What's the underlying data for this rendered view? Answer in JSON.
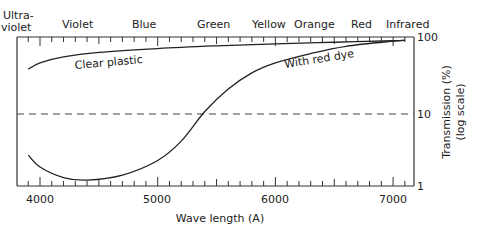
{
  "chart_data": {
    "type": "line",
    "title": "",
    "xlabel": "Wave length (A)",
    "ylabel": "Transmission (%) (log scale)",
    "ylabel_lines": [
      "Transmission (%)",
      "(log scale)"
    ],
    "xlim": [
      3800,
      7170
    ],
    "ylim": [
      1,
      100
    ],
    "yscale": "log",
    "x_ticks": [
      "4000",
      "5000",
      "6000",
      "7000"
    ],
    "y_ticks": [
      "1",
      "10",
      "100"
    ],
    "top_band_labels": [
      "Ultra-\nviolet",
      "Violet",
      "Blue",
      "Green",
      "Yellow",
      "Orange",
      "Red",
      "Infrared"
    ],
    "top_band_label_lines": {
      "ultraviolet": [
        "Ultra-",
        "violet"
      ],
      "violet": "Violet",
      "blue": "Blue",
      "green": "Green",
      "yellow": "Yellow",
      "orange": "Orange",
      "red": "Red",
      "infrared": "Infrared"
    },
    "reference_line": {
      "y": 10,
      "style": "dashed"
    },
    "series": [
      {
        "name": "Clear plastic",
        "x": [
          3900,
          4000,
          4200,
          4500,
          5000,
          5500,
          6000,
          6500,
          7000,
          7100
        ],
        "values": [
          37,
          45,
          54,
          62,
          70,
          76,
          81,
          85,
          89,
          90
        ]
      },
      {
        "name": "With red dye",
        "x": [
          3900,
          4000,
          4200,
          4400,
          4700,
          5000,
          5200,
          5400,
          5600,
          5800,
          6000,
          6300,
          6600,
          7000,
          7100
        ],
        "values": [
          2.6,
          1.8,
          1.3,
          1.2,
          1.4,
          2.2,
          4.0,
          10,
          20,
          33,
          45,
          60,
          75,
          88,
          90
        ]
      }
    ],
    "annotations": [
      "Clear plastic",
      "With red dye"
    ],
    "grid": false,
    "legend": "inline labels"
  }
}
